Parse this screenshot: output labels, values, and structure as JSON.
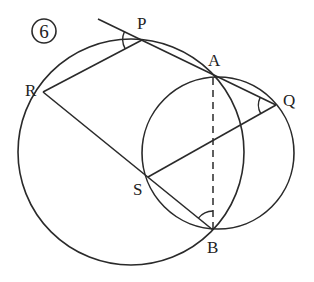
{
  "figure": {
    "number_label": "6",
    "points": {
      "P": {
        "label": "P",
        "x": 142,
        "y": 40
      },
      "A": {
        "label": "A",
        "x": 213,
        "y": 76
      },
      "Q": {
        "label": "Q",
        "x": 276,
        "y": 105
      },
      "R": {
        "label": "R",
        "x": 43,
        "y": 92
      },
      "S": {
        "label": "S",
        "x": 148,
        "y": 177
      },
      "B": {
        "label": "B",
        "x": 213,
        "y": 230
      }
    },
    "circles": [
      {
        "name": "large-circle",
        "cx": 131,
        "cy": 152,
        "r": 113
      },
      {
        "name": "small-circle",
        "cx": 218,
        "cy": 153,
        "r": 76
      }
    ],
    "segments": [
      "tangent-through-P-to-Q",
      "P-R",
      "R-S-B",
      "Q-S",
      "A-B (dashed)"
    ],
    "marked_angles": [
      "angle at P",
      "angle at Q",
      "angle at B"
    ]
  }
}
